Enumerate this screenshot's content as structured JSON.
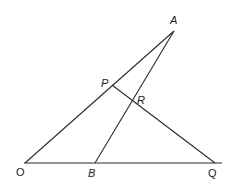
{
  "diagram": {
    "points": {
      "O": {
        "label": "O",
        "x": 25,
        "y": 163
      },
      "A": {
        "label": "A",
        "x": 174,
        "y": 31
      },
      "P": {
        "label": "P",
        "x": 112,
        "y": 85
      },
      "R": {
        "label": "R",
        "x": 132,
        "y": 99
      },
      "B": {
        "label": "B",
        "x": 95,
        "y": 163
      },
      "Q": {
        "label": "Q",
        "x": 215,
        "y": 163
      }
    },
    "segments": [
      [
        "O",
        "A"
      ],
      [
        "O",
        "Q"
      ],
      [
        "B",
        "A"
      ],
      [
        "P",
        "Q"
      ]
    ]
  }
}
